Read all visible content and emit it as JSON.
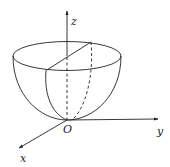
{
  "figure": {
    "labels": {
      "z_axis": "z",
      "y_axis": "y",
      "x_axis": "x",
      "origin": "O"
    },
    "colors": {
      "stroke": "#222222",
      "background": "#ffffff"
    }
  }
}
